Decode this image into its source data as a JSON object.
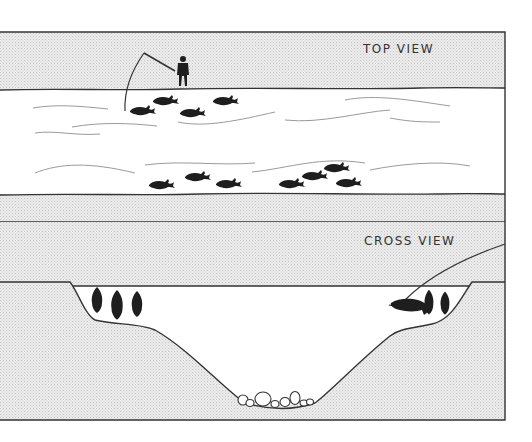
{
  "figure": {
    "top_view": {
      "label": "TOP VIEW",
      "elements": [
        "angler-on-bank",
        "fishing-rod-and-line",
        "river-channel",
        "water-ripples",
        "fish-near-bank-group",
        "fish-far-bank-group"
      ],
      "fish_near_bank_count": 4,
      "fish_far_bank_count": 7
    },
    "cross_view": {
      "label": "CROSS VIEW",
      "elements": [
        "river-bed-profile",
        "left-shelf",
        "right-shelf",
        "deep-channel",
        "bottom-rocks",
        "fishing-line"
      ],
      "left_shelf_fish_count": 3,
      "right_shelf_fish_count": 3,
      "rock_count": 8
    },
    "colors": {
      "bank_fill": "#e4e4e4",
      "water_fill": "#ffffff",
      "line": "#333333",
      "fish": "#1e1e1e",
      "ripple": "#9a9a9a"
    }
  }
}
